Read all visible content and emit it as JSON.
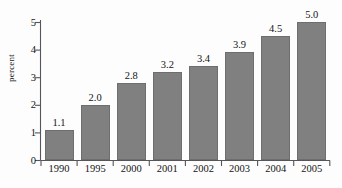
{
  "chart_data": {
    "type": "bar",
    "title": "",
    "subtitle": "",
    "xlabel": "",
    "ylabel": "percent",
    "categories": [
      "1990",
      "1995",
      "2000",
      "2001",
      "2002",
      "2003",
      "2004",
      "2005"
    ],
    "values": [
      1.1,
      2.0,
      2.8,
      3.2,
      3.4,
      3.9,
      4.5,
      5.0
    ],
    "data_labels": [
      "1.1",
      "2.0",
      "2.8",
      "3.2",
      "3.4",
      "3.9",
      "4.5",
      "5.0"
    ],
    "ylim": [
      0,
      5
    ],
    "y_ticks": [
      0,
      1,
      2,
      3,
      4,
      5
    ],
    "y_tick_labels": [
      "0",
      "1",
      "2",
      "3",
      "4",
      "5"
    ],
    "grid": false,
    "legend": null,
    "legend_position": "none",
    "series": [
      {
        "name": "percent",
        "values": [
          1.1,
          2.0,
          2.8,
          3.2,
          3.4,
          3.9,
          4.5,
          5.0
        ]
      }
    ],
    "colors": {
      "bar_fill": "#808080",
      "bar_edge": "#6e6e6e",
      "axis": "#55555a",
      "text": "#141414",
      "background": "#fdfdfd"
    }
  }
}
